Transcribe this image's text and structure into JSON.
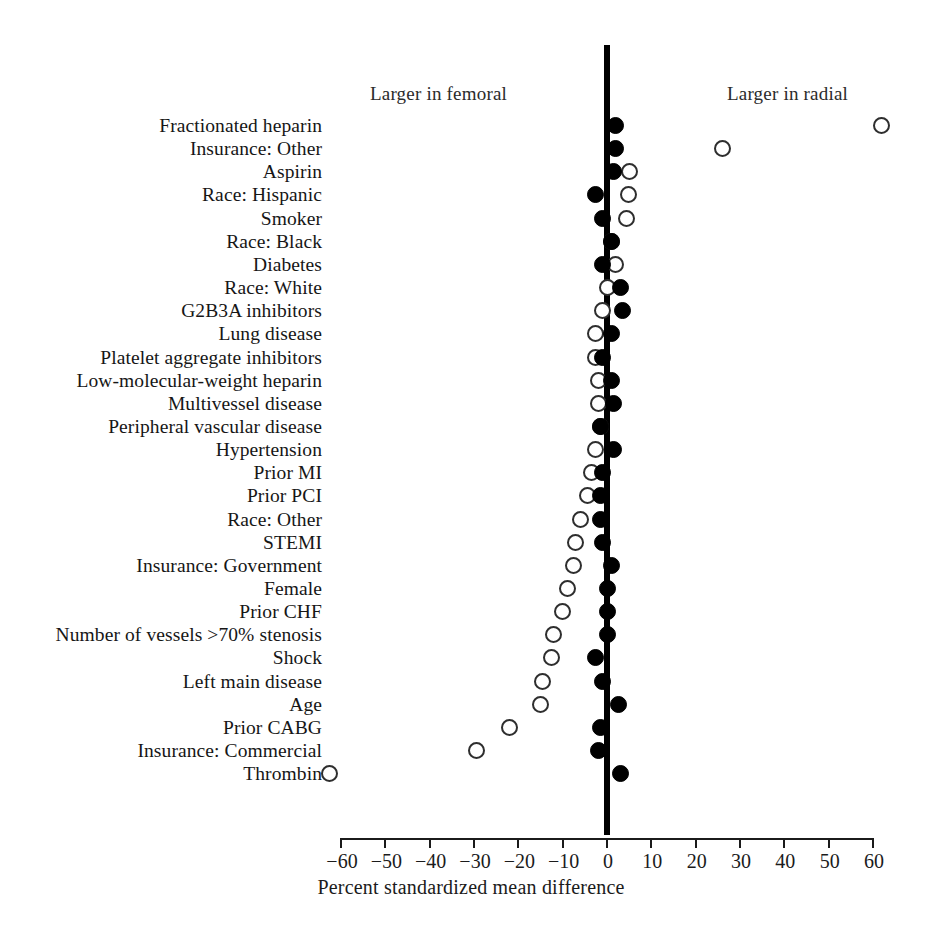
{
  "chart_data": {
    "type": "scatter",
    "title": "",
    "xlabel": "Percent standardized mean difference",
    "ylabel": "",
    "xlim": [
      -60,
      60
    ],
    "xticks": [
      -60,
      -50,
      -40,
      -30,
      -20,
      -10,
      0,
      10,
      20,
      30,
      40,
      50,
      60
    ],
    "xticklabels": [
      "−60",
      "−50",
      "−40",
      "−30",
      "−20",
      "−10",
      "0",
      "10",
      "20",
      "30",
      "40",
      "50",
      "60"
    ],
    "grid": false,
    "legend_position": "none",
    "reference_line_x": 0,
    "annotations": [
      {
        "text": "Larger in femoral",
        "side": "left"
      },
      {
        "text": "Larger in radial",
        "side": "right"
      }
    ],
    "series": [
      {
        "name": "unadjusted",
        "marker": "open-circle",
        "fill": "#ffffff",
        "edge": "#2e2e2e"
      },
      {
        "name": "adjusted",
        "marker": "filled-circle",
        "fill": "#000000",
        "edge": "#000000"
      }
    ],
    "categories": [
      "Fractionated heparin",
      "Insurance: Other",
      "Aspirin",
      "Race: Hispanic",
      "Smoker",
      "Race: Black",
      "Diabetes",
      "Race: White",
      "G2B3A inhibitors",
      "Lung disease",
      "Platelet aggregate inhibitors",
      "Low-molecular-weight heparin",
      "Multivessel disease",
      "Peripheral vascular disease",
      "Hypertension",
      "Prior MI",
      "Prior PCI",
      "Race: Other",
      "STEMI",
      "Insurance: Government",
      "Female",
      "Prior CHF",
      "Number of vessels >70% stenosis",
      "Shock",
      "Left main disease",
      "Age",
      "Prior CABG",
      "Insurance: Commercial",
      "Thrombin"
    ],
    "rows": [
      {
        "label": "Fractionated heparin",
        "open": 62.0,
        "filled": 2.0
      },
      {
        "label": "Insurance: Other",
        "open": 26.0,
        "filled": 2.0
      },
      {
        "label": "Aspirin",
        "open": 5.0,
        "filled": 1.5
      },
      {
        "label": "Race: Hispanic",
        "open": 4.8,
        "filled": -2.5
      },
      {
        "label": "Smoker",
        "open": 4.5,
        "filled": -1.0
      },
      {
        "label": "Race: Black",
        "open": 1.0,
        "filled": 1.0
      },
      {
        "label": "Diabetes",
        "open": 2.0,
        "filled": -1.0
      },
      {
        "label": "Race: White",
        "open": 0.0,
        "filled": 3.0
      },
      {
        "label": "G2B3A inhibitors",
        "open": -1.0,
        "filled": 3.5
      },
      {
        "label": "Lung disease",
        "open": -2.5,
        "filled": 1.0
      },
      {
        "label": "Platelet aggregate inhibitors",
        "open": -2.5,
        "filled": -1.0
      },
      {
        "label": "Low-molecular-weight heparin",
        "open": -2.0,
        "filled": 1.0
      },
      {
        "label": "Multivessel disease",
        "open": -2.0,
        "filled": 1.5
      },
      {
        "label": "Peripheral vascular disease",
        "open": -1.5,
        "filled": -1.5
      },
      {
        "label": "Hypertension",
        "open": -2.5,
        "filled": 1.5
      },
      {
        "label": "Prior MI",
        "open": -3.5,
        "filled": -1.0
      },
      {
        "label": "Prior PCI",
        "open": -4.5,
        "filled": -1.5
      },
      {
        "label": "Race: Other",
        "open": -6.0,
        "filled": -1.5
      },
      {
        "label": "STEMI",
        "open": -7.0,
        "filled": -1.0
      },
      {
        "label": "Insurance: Government",
        "open": -7.5,
        "filled": 1.0
      },
      {
        "label": "Female",
        "open": -9.0,
        "filled": 0.0
      },
      {
        "label": "Prior CHF",
        "open": -10.0,
        "filled": 0.0
      },
      {
        "label": "Number of vessels >70% stenosis",
        "open": -12.0,
        "filled": 0.0
      },
      {
        "label": "Shock",
        "open": -12.5,
        "filled": -2.5
      },
      {
        "label": "Left main disease",
        "open": -14.5,
        "filled": -1.0
      },
      {
        "label": "Age",
        "open": -15.0,
        "filled": 2.5
      },
      {
        "label": "Prior CABG",
        "open": -22.0,
        "filled": -1.5
      },
      {
        "label": "Insurance: Commercial",
        "open": -29.5,
        "filled": -2.0
      },
      {
        "label": "Thrombin",
        "open": -62.5,
        "filled": 3.0
      }
    ]
  }
}
